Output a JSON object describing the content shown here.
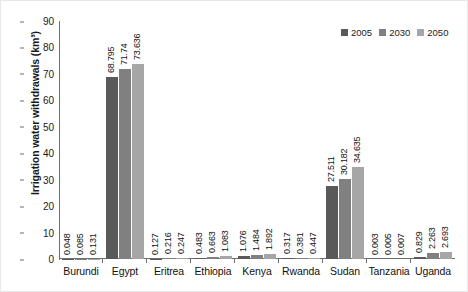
{
  "chart_data": {
    "type": "bar",
    "title": "",
    "subtitle": "",
    "xlabel": "",
    "ylabel": "Irrigation water withdrawals (km³)",
    "ylim": [
      0,
      90
    ],
    "y_ticks": [
      0,
      10,
      20,
      30,
      40,
      50,
      60,
      70,
      80,
      90
    ],
    "grid": false,
    "legend_position": "top-right",
    "categories": [
      "Burundi",
      "Egypt",
      "Eritrea",
      "Ethiopia",
      "Kenya",
      "Rwanda",
      "Sudan",
      "Tanzania",
      "Uganda"
    ],
    "series": [
      {
        "name": "2005",
        "color": "#595959",
        "values": [
          0.048,
          68.795,
          0.127,
          0.483,
          1.076,
          0.317,
          27.511,
          0.003,
          0.829
        ],
        "labels": [
          "0.048",
          "68.795",
          "0.127",
          "0.483",
          "1.076",
          "0.317",
          "27.511",
          "0.003",
          "0.829"
        ]
      },
      {
        "name": "2030",
        "color": "#808080",
        "values": [
          0.085,
          71.74,
          0.216,
          0.663,
          1.484,
          0.381,
          30.182,
          0.005,
          2.263
        ],
        "labels": [
          "0.085",
          "71.74",
          "0.216",
          "0.663",
          "1.484",
          "0.381",
          "30.182",
          "0.005",
          "2.263"
        ]
      },
      {
        "name": "2050",
        "color": "#a6a6a6",
        "values": [
          0.131,
          73.636,
          0.247,
          1.083,
          1.892,
          0.447,
          34.635,
          0.007,
          2.693
        ],
        "labels": [
          "0.131",
          "73.636",
          "0.247",
          "1.083",
          "1.892",
          "0.447",
          "34.635",
          "0.007",
          "2.693"
        ]
      }
    ]
  },
  "legend": {
    "items": [
      {
        "label": "2005"
      },
      {
        "label": "2030"
      },
      {
        "label": "2050"
      }
    ]
  },
  "axis": {
    "y_title": "Irrigation water withdrawals (km³)",
    "y_tick_labels": [
      "90",
      "80",
      "70",
      "60",
      "50",
      "40",
      "30",
      "20",
      "10",
      "0"
    ]
  }
}
